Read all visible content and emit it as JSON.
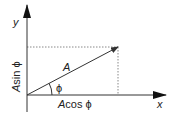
{
  "diagram": {
    "title": "",
    "axes": {
      "x_label": "x",
      "y_label": "y"
    },
    "vector": {
      "label": "A",
      "angle_label": "ϕ"
    },
    "components": {
      "horizontal": {
        "prefix": "A",
        "text": "cos ϕ"
      },
      "vertical": {
        "prefix": "A",
        "text": "sin ϕ"
      }
    },
    "colors": {
      "line": "#333333",
      "dotted": "#888888",
      "text": "#222222",
      "background": "#ffffff"
    }
  }
}
